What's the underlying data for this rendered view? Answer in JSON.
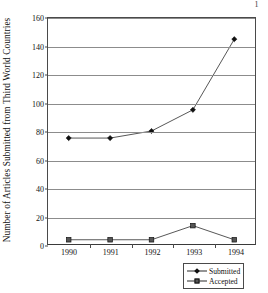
{
  "page": {
    "corner_mark": "1"
  },
  "chart_data": {
    "type": "line",
    "title": "",
    "xlabel": "",
    "ylabel": "Number of Articles Submitted from Third World Countries",
    "categories": [
      "1990",
      "1991",
      "1992",
      "1993",
      "1994"
    ],
    "ylim": [
      0,
      160
    ],
    "ytick_values": [
      0,
      20,
      40,
      60,
      80,
      100,
      120,
      140,
      160
    ],
    "ytick_labels": [
      "0",
      "20",
      "40",
      "60",
      "80",
      "100",
      "120",
      "140",
      "160"
    ],
    "grid": "horizontal",
    "legend_position": "bottom-right",
    "series": [
      {
        "name": "Submitted",
        "marker": "diamond",
        "color": "#111111",
        "values": [
          75,
          75,
          80,
          95,
          145
        ]
      },
      {
        "name": "Accepted",
        "marker": "square",
        "color": "#555555",
        "values": [
          3,
          3,
          3,
          13,
          3
        ]
      }
    ]
  }
}
